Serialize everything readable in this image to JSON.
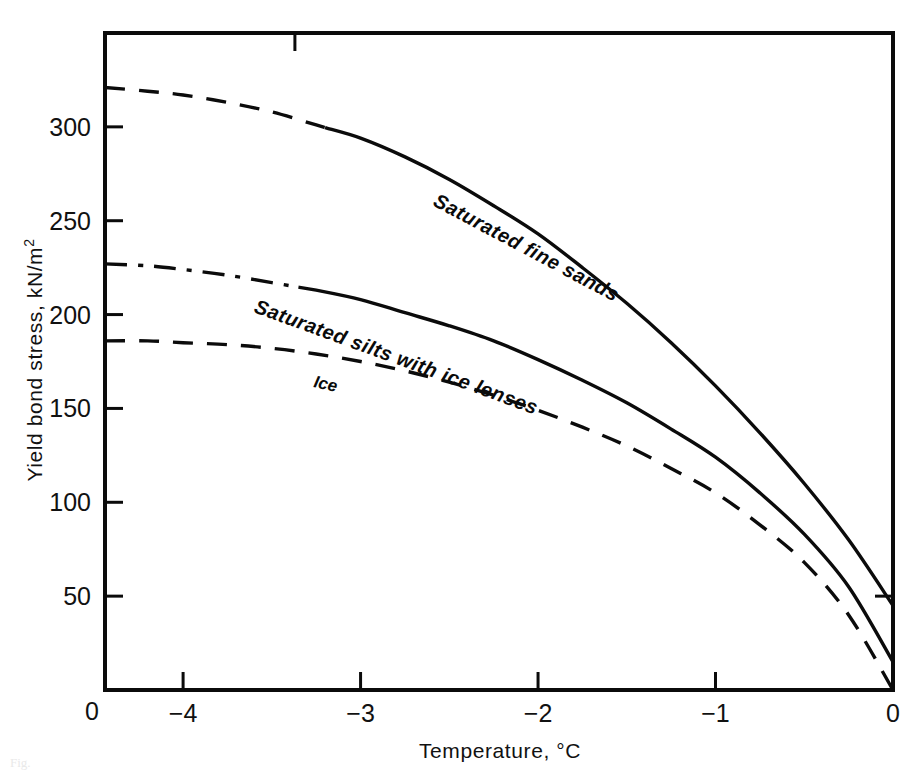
{
  "figure": {
    "background_color": "#ffffff",
    "ink_color": "#0b0b0b",
    "caption_fragment": "Fig."
  },
  "chart_data": {
    "type": "line",
    "title": "",
    "xlabel": "Temperature, °C",
    "ylabel": "Yield bond stress, kN/m",
    "ylabel_superscript": "2",
    "xlabel_ticks": [
      "0",
      "−4",
      "−3",
      "−2",
      "−1",
      "0"
    ],
    "xticks": [
      -4,
      -3,
      -2,
      -1,
      0
    ],
    "xtick_labels": [
      "−4",
      "−3",
      "−2",
      "−1",
      "0"
    ],
    "origin_label": "0",
    "yticks": [
      50,
      100,
      150,
      200,
      250,
      300
    ],
    "ytick_labels": [
      "50",
      "100",
      "150",
      "200",
      "250",
      "300"
    ],
    "xlim": [
      -4.44,
      0
    ],
    "ylim": [
      0,
      350
    ],
    "grid": false,
    "legend": "inline-curve-labels",
    "series": [
      {
        "name": "Saturated fine sands",
        "label": "Saturated fine sands",
        "line_style": "dashed-then-solid",
        "dash_until_x": -3.2,
        "points": [
          [
            -4.44,
            321
          ],
          [
            -4.2,
            319
          ],
          [
            -4.0,
            317
          ],
          [
            -3.75,
            313
          ],
          [
            -3.5,
            308
          ],
          [
            -3.25,
            301
          ],
          [
            -3.0,
            294
          ],
          [
            -2.75,
            284
          ],
          [
            -2.5,
            272
          ],
          [
            -2.25,
            258
          ],
          [
            -2.0,
            243
          ],
          [
            -1.75,
            225
          ],
          [
            -1.5,
            206
          ],
          [
            -1.25,
            185
          ],
          [
            -1.0,
            162
          ],
          [
            -0.75,
            137
          ],
          [
            -0.5,
            110
          ],
          [
            -0.25,
            80
          ],
          [
            0,
            45
          ]
        ]
      },
      {
        "name": "Saturated silts with ice lenses",
        "label": "Saturated silts with ice lenses",
        "line_style": "dashdot-then-solid",
        "dash_until_x": -3.35,
        "points": [
          [
            -4.44,
            227
          ],
          [
            -4.2,
            226
          ],
          [
            -4.0,
            224
          ],
          [
            -3.75,
            221
          ],
          [
            -3.5,
            217
          ],
          [
            -3.25,
            213
          ],
          [
            -3.0,
            208
          ],
          [
            -2.75,
            201
          ],
          [
            -2.5,
            194
          ],
          [
            -2.25,
            186
          ],
          [
            -2.0,
            176
          ],
          [
            -1.75,
            165
          ],
          [
            -1.5,
            153
          ],
          [
            -1.25,
            139
          ],
          [
            -1.0,
            124
          ],
          [
            -0.75,
            105
          ],
          [
            -0.5,
            83
          ],
          [
            -0.25,
            55
          ],
          [
            0,
            15
          ]
        ]
      },
      {
        "name": "Ice",
        "label": "Ice",
        "line_style": "dashed",
        "points": [
          [
            -4.44,
            186
          ],
          [
            -4.2,
            186
          ],
          [
            -4.0,
            185
          ],
          [
            -3.75,
            184
          ],
          [
            -3.5,
            182
          ],
          [
            -3.25,
            179
          ],
          [
            -3.0,
            175
          ],
          [
            -2.75,
            170
          ],
          [
            -2.5,
            164
          ],
          [
            -2.25,
            157
          ],
          [
            -2.0,
            149
          ],
          [
            -1.75,
            140
          ],
          [
            -1.5,
            130
          ],
          [
            -1.25,
            118
          ],
          [
            -1.0,
            105
          ],
          [
            -0.75,
            88
          ],
          [
            -0.5,
            68
          ],
          [
            -0.25,
            40
          ],
          [
            0,
            0
          ]
        ]
      }
    ]
  }
}
